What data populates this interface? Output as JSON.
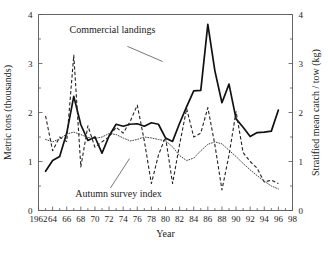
{
  "chart_data": {
    "type": "line",
    "title": "",
    "xlabel": "Year",
    "ylabel": "Metric tons (thousands)",
    "y2label": "Stratified mean catch / tow (kg)",
    "xlim": [
      1962,
      1998
    ],
    "ylim": [
      0,
      4
    ],
    "y2lim": [
      0,
      4
    ],
    "grid": false,
    "legend_position": "inline-annotations",
    "x_major_ticks": [
      1962,
      1964,
      1966,
      1968,
      1970,
      1972,
      1974,
      1976,
      1978,
      1980,
      1982,
      1984,
      1986,
      1988,
      1990,
      1992,
      1994,
      1996,
      1998
    ],
    "x_major_tick_labels": [
      "1962",
      "64",
      "66",
      "68",
      "70",
      "72",
      "74",
      "76",
      "78",
      "80",
      "82",
      "84",
      "86",
      "88",
      "90",
      "92",
      "94",
      "96",
      "98"
    ],
    "x_minor_tick_interval": 1,
    "y_ticks": [
      0,
      1,
      2,
      3,
      4
    ],
    "y_tick_labels": [
      "0",
      "1",
      "2",
      "3",
      "4"
    ],
    "y_minor_tick_interval": 0.5,
    "y2_ticks": [
      0,
      1,
      2,
      3,
      4
    ],
    "y2_tick_labels": [
      "0",
      "1",
      "2",
      "3",
      "4"
    ],
    "annotations": [
      {
        "name": "commercial-landings-annotation",
        "text": "Commercial landings",
        "text_x": 1966.4,
        "text_y": 3.62,
        "leader_from": [
          1974.6,
          3.35
        ],
        "leader_to": [
          1979.6,
          3.04
        ]
      },
      {
        "name": "autumn-survey-index-annotation",
        "text": "Autumn survey index",
        "text_x": 1967.2,
        "text_y": 0.28,
        "leader_from": [
          1972.2,
          0.46
        ],
        "leader_to": [
          1974.9,
          1.06
        ]
      }
    ],
    "x": [
      1963,
      1964,
      1965,
      1966,
      1967,
      1968,
      1969,
      1970,
      1971,
      1972,
      1973,
      1974,
      1975,
      1976,
      1977,
      1978,
      1979,
      1980,
      1981,
      1982,
      1983,
      1984,
      1985,
      1986,
      1987,
      1988,
      1989,
      1990,
      1991,
      1992,
      1993,
      1994,
      1995,
      1996
    ],
    "series": [
      {
        "name": "Commercial landings",
        "style": "solid",
        "axis": "left",
        "units": "Metric tons (thousands)",
        "values": [
          0.8,
          1.02,
          1.1,
          1.58,
          2.33,
          1.75,
          1.43,
          1.5,
          1.17,
          1.52,
          1.76,
          1.72,
          1.76,
          1.77,
          1.72,
          1.79,
          1.76,
          1.48,
          1.41,
          1.78,
          2.12,
          2.44,
          2.45,
          3.8,
          2.85,
          2.2,
          2.58,
          1.87,
          1.7,
          1.51,
          1.59,
          1.6,
          1.62,
          2.05
        ]
      },
      {
        "name": "Autumn survey index",
        "style": "dashed",
        "axis": "right",
        "units": "Stratified mean catch / tow (kg)",
        "values": [
          1.93,
          1.22,
          1.5,
          1.41,
          3.17,
          0.89,
          1.73,
          1.29,
          1.4,
          1.5,
          1.7,
          1.58,
          1.82,
          2.15,
          1.42,
          0.55,
          1.13,
          1.5,
          0.55,
          1.35,
          2.08,
          1.5,
          1.58,
          2.1,
          1.34,
          0.42,
          1.13,
          2.02,
          1.18,
          1.0,
          0.86,
          0.58,
          0.62,
          0.55
        ]
      },
      {
        "name": "Autumn survey index smoothed",
        "style": "dotted",
        "axis": "right",
        "units": "Stratified mean catch / tow (kg)",
        "values": [
          1.45,
          1.4,
          1.46,
          1.56,
          1.6,
          1.55,
          1.49,
          1.47,
          1.5,
          1.57,
          1.55,
          1.48,
          1.42,
          1.45,
          1.5,
          1.48,
          1.45,
          1.42,
          1.3,
          1.12,
          1.02,
          1.07,
          1.22,
          1.35,
          1.4,
          1.36,
          1.23,
          1.1,
          0.96,
          0.83,
          0.71,
          0.6,
          0.5,
          0.44
        ]
      }
    ],
    "commercial_landings_x": [
      1963,
      1964,
      1965,
      1966,
      1967,
      1968,
      1969,
      1970,
      1971,
      1972,
      1973,
      1974,
      1975,
      1976,
      1977,
      1978,
      1979,
      1980,
      1981,
      1982,
      1983,
      1984,
      1985,
      1986,
      1987,
      1988,
      1989,
      1990,
      1991,
      1992,
      1993,
      1994,
      1995,
      1996
    ],
    "commercial_landings_y": [
      0.8,
      1.02,
      1.1,
      1.58,
      2.33,
      1.75,
      1.43,
      1.5,
      1.17,
      1.52,
      1.76,
      1.72,
      1.76,
      1.77,
      1.72,
      1.79,
      1.76,
      1.48,
      1.41,
      1.78,
      2.12,
      2.44,
      2.45,
      3.8,
      2.85,
      2.2,
      2.58,
      1.87,
      1.7,
      1.51,
      1.59,
      1.6,
      1.62,
      2.05
    ],
    "survey_index_x": [
      1963,
      1964,
      1965,
      1966,
      1967,
      1968,
      1969,
      1970,
      1971,
      1972,
      1973,
      1974,
      1975,
      1976,
      1977,
      1978,
      1979,
      1980,
      1981,
      1982,
      1983,
      1984,
      1985,
      1986,
      1987,
      1988,
      1989,
      1990,
      1991,
      1992,
      1993,
      1994,
      1995,
      1996
    ],
    "survey_index_y": [
      1.93,
      1.22,
      1.5,
      1.41,
      3.17,
      0.89,
      1.73,
      1.29,
      1.4,
      1.5,
      1.7,
      1.58,
      1.82,
      2.15,
      1.42,
      0.55,
      1.13,
      1.5,
      0.55,
      1.35,
      2.08,
      1.5,
      1.58,
      2.1,
      1.34,
      0.42,
      1.13,
      2.02,
      1.18,
      1.0,
      0.86,
      0.58,
      0.62,
      0.55
    ]
  },
  "axes": {
    "x_title": "Year",
    "y_left_title": "Metric tons (thousands)",
    "y_right_title": "Stratified mean catch / tow (kg)"
  },
  "labels": {
    "commercial_landings": "Commercial landings",
    "autumn_survey_index": "Autumn survey index"
  },
  "colors": {
    "background": "#ffffff",
    "axis": "#555555",
    "solid_series": "#111111",
    "dashed_series": "#222222",
    "dotted_series": "#444444",
    "text": "#1a1a1a"
  }
}
